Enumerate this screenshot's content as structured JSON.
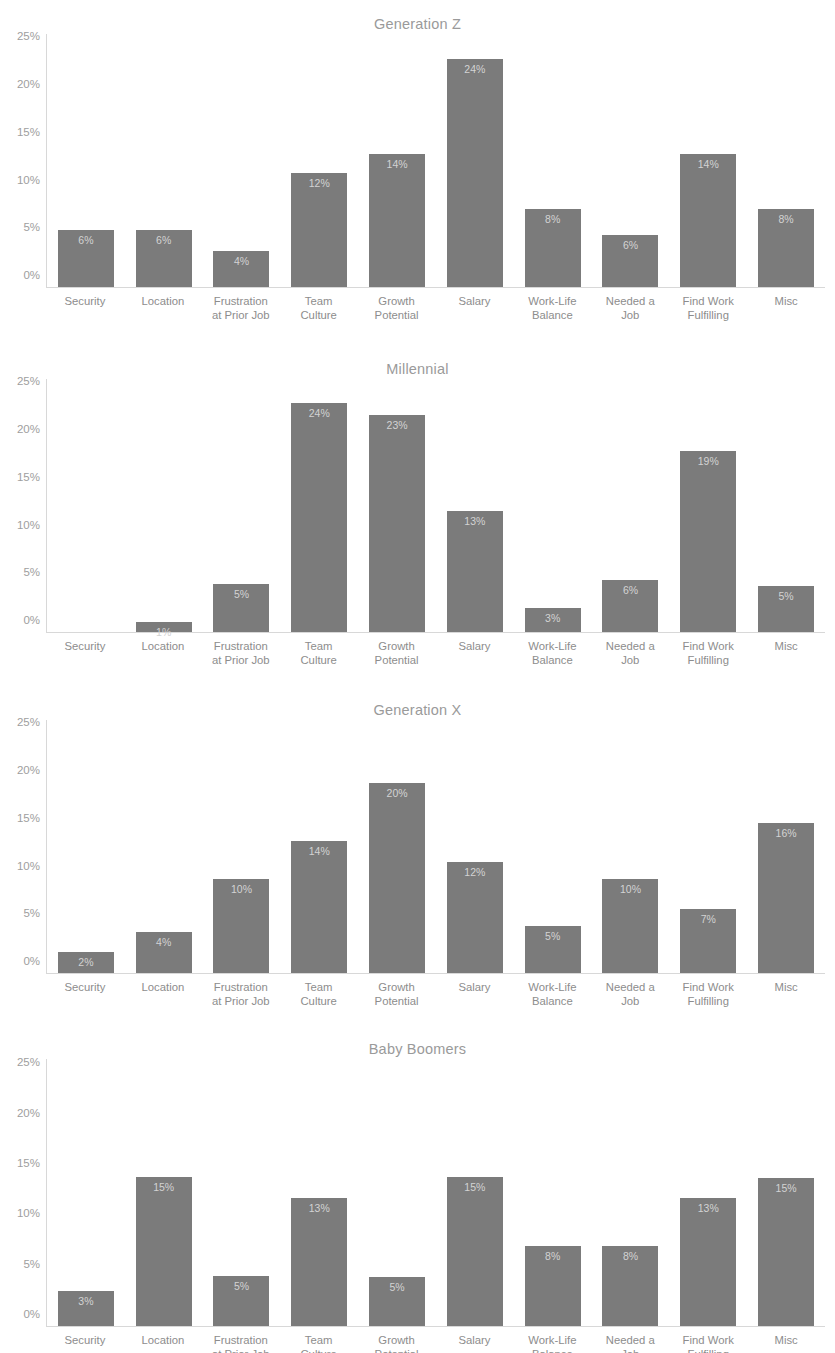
{
  "page": {
    "top_cut_text": "",
    "background": "#ffffff",
    "bar_color": "#7b7b7b",
    "label_color": "#d3d3d3",
    "axis_color": "#d8d8d8",
    "tick_color": "#9e9e9e",
    "title_color": "#9a9a9a"
  },
  "axis": {
    "yticks": [
      "0%",
      "5%",
      "10%",
      "15%",
      "20%",
      "25%"
    ],
    "ytick_values": [
      0,
      5,
      10,
      15,
      20,
      25
    ],
    "ymax": 26.5,
    "categories": [
      "Security",
      "Location",
      "Frustration\nat Prior Job",
      "Team\nCulture",
      "Growth\nPotential",
      "Salary",
      "Work-Life\nBalance",
      "Needed a\nJob",
      "Find Work\nFulfilling",
      "Misc"
    ]
  },
  "chart_data": [
    {
      "type": "bar",
      "title": "Generation Z",
      "xlabel": "",
      "ylabel": "",
      "ylim": [
        0,
        26.5
      ],
      "grid": false,
      "legend": "none",
      "categories": [
        "Security",
        "Location",
        "Frustration at Prior Job",
        "Team Culture",
        "Growth Potential",
        "Salary",
        "Work-Life Balance",
        "Needed a Job",
        "Find Work Fulfilling",
        "Misc"
      ],
      "values": [
        6.0,
        6.0,
        3.8,
        11.9,
        13.9,
        23.9,
        8.2,
        5.5,
        13.9,
        8.2
      ],
      "data_labels": [
        "6%",
        "6%",
        "4%",
        "12%",
        "14%",
        "24%",
        "8%",
        "6%",
        "14%",
        "8%"
      ]
    },
    {
      "type": "bar",
      "title": "Millennial",
      "xlabel": "",
      "ylabel": "",
      "ylim": [
        0,
        26.5
      ],
      "grid": false,
      "legend": "none",
      "categories": [
        "Security",
        "Location",
        "Frustration at Prior Job",
        "Team Culture",
        "Growth Potential",
        "Salary",
        "Work-Life Balance",
        "Needed a Job",
        "Find Work Fulfilling",
        "Misc"
      ],
      "values": [
        0.0,
        1.1,
        5.0,
        24.0,
        22.7,
        12.7,
        2.5,
        5.5,
        19.0,
        4.8
      ],
      "data_labels": [
        "",
        "1%",
        "5%",
        "24%",
        "23%",
        "13%",
        "3%",
        "6%",
        "19%",
        "5%"
      ]
    },
    {
      "type": "bar",
      "title": "Generation X",
      "xlabel": "",
      "ylabel": "",
      "ylim": [
        0,
        26.5
      ],
      "grid": false,
      "legend": "none",
      "categories": [
        "Security",
        "Location",
        "Frustration at Prior Job",
        "Team Culture",
        "Growth Potential",
        "Salary",
        "Work-Life Balance",
        "Needed a Job",
        "Find Work Fulfilling",
        "Misc"
      ],
      "values": [
        2.2,
        4.3,
        9.8,
        13.8,
        19.9,
        11.6,
        4.9,
        9.8,
        6.7,
        15.7
      ],
      "data_labels": [
        "2%",
        "4%",
        "10%",
        "14%",
        "20%",
        "12%",
        "5%",
        "10%",
        "7%",
        "16%"
      ]
    },
    {
      "type": "bar",
      "title": "Baby Boomers",
      "xlabel": "",
      "ylabel": "",
      "ylim": [
        0,
        26.5
      ],
      "grid": false,
      "legend": "none",
      "categories": [
        "Security",
        "Location",
        "Frustration at Prior Job",
        "Team Culture",
        "Growth Potential",
        "Salary",
        "Work-Life Balance",
        "Needed a Job",
        "Find Work Fulfilling",
        "Misc"
      ],
      "values": [
        3.5,
        14.8,
        5.0,
        12.7,
        4.9,
        14.8,
        7.9,
        7.9,
        12.7,
        14.7
      ],
      "data_labels": [
        "3%",
        "15%",
        "5%",
        "13%",
        "5%",
        "15%",
        "8%",
        "8%",
        "13%",
        "15%"
      ]
    }
  ],
  "panels": [
    {
      "top": 14,
      "plot_height": 300
    },
    {
      "top": 359,
      "plot_height": 300
    },
    {
      "top": 700,
      "plot_height": 300
    },
    {
      "top": 1039,
      "plot_height": 314
    }
  ]
}
